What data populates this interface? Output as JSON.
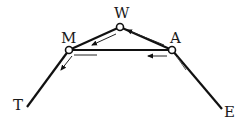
{
  "diagram": {
    "nodes": {
      "W": {
        "label": "W",
        "x": 120,
        "y": 27
      },
      "M": {
        "label": "M",
        "x": 69,
        "y": 50
      },
      "A": {
        "label": "A",
        "x": 172,
        "y": 50
      }
    },
    "endpoints": {
      "T": {
        "label": "T",
        "x": 27,
        "y": 107
      },
      "E": {
        "label": "E",
        "x": 222,
        "y": 109
      }
    },
    "edges": [
      {
        "from": "T",
        "to": "M"
      },
      {
        "from": "M",
        "to": "W"
      },
      {
        "from": "W",
        "to": "A"
      },
      {
        "from": "M",
        "to": "A"
      },
      {
        "from": "A",
        "to": "E"
      }
    ],
    "flow_arrows": [
      {
        "along": "W-M",
        "direction": "toward M"
      },
      {
        "along": "A-W",
        "direction": "toward W"
      },
      {
        "along": "A-M",
        "direction": "toward M"
      },
      {
        "along": "M-T",
        "direction": "toward T"
      }
    ],
    "colors": {
      "line": "#111111",
      "node_fill": "#ffffff"
    }
  }
}
